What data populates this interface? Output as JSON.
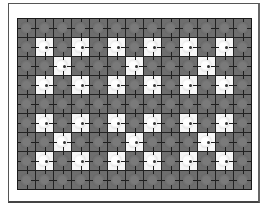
{
  "board": {
    "columns": 13,
    "rows": 9,
    "colors": {
      "tile": "#6e6e6e",
      "revealed": "#f6f6f6",
      "grid_line": "#222222",
      "background": "#ffffff"
    },
    "pattern": [
      "ggggggggggggg",
      "gwgwgwgwgwgwg",
      "ggwgggwgggwgg",
      "gwgwgwgwgwgwg",
      "ggggggggggggg",
      "gwgwgwgwgwgwg",
      "ggwgggwgggwgg",
      "gwgwgwgwgwgwg",
      "ggggggggggggg"
    ]
  }
}
